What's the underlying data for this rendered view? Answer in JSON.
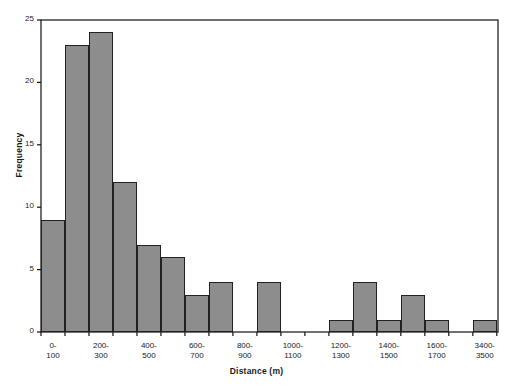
{
  "chart_data": {
    "type": "bar",
    "title": "",
    "xlabel": "Distance (m)",
    "ylabel": "Frequency",
    "ylim": [
      0,
      25
    ],
    "yticks": [
      0,
      5,
      10,
      15,
      20,
      25
    ],
    "ytick_labels": [
      "0",
      "5",
      "10",
      "15",
      "20",
      "25"
    ],
    "grid": false,
    "legend": "none",
    "categories": [
      "0-100",
      "100-200",
      "200-300",
      "300-400",
      "400-500",
      "500-600",
      "600-700",
      "700-800",
      "800-900",
      "900-1000",
      "1000-1100",
      "1100-1200",
      "1200-1300",
      "1300-1400",
      "1400-1500",
      "1500-1600",
      "1600-1700",
      "1700-1800",
      "3400-3500"
    ],
    "values": [
      9,
      23,
      24,
      12,
      7,
      6,
      3,
      4,
      0,
      4,
      0,
      0,
      1,
      4,
      1,
      3,
      1,
      0,
      1
    ],
    "visible_xtick_labels": [
      {
        "index": 0,
        "line1": "0-",
        "line2": "100"
      },
      {
        "index": 2,
        "line1": "200-",
        "line2": "300"
      },
      {
        "index": 4,
        "line1": "400-",
        "line2": "500"
      },
      {
        "index": 6,
        "line1": "600-",
        "line2": "700"
      },
      {
        "index": 8,
        "line1": "800-",
        "line2": "900"
      },
      {
        "index": 10,
        "line1": "1000-",
        "line2": "1100"
      },
      {
        "index": 12,
        "line1": "1200-",
        "line2": "1300"
      },
      {
        "index": 14,
        "line1": "1400-",
        "line2": "1500"
      },
      {
        "index": 16,
        "line1": "1600-",
        "line2": "1700"
      },
      {
        "index": 18,
        "line1": "3400-",
        "line2": "3500"
      }
    ],
    "colors": {
      "bar_fill": "#8d8d8d",
      "bar_edge": "#222222",
      "axis": "#111111",
      "text": "#1a1a1a",
      "background": "#ffffff"
    }
  }
}
